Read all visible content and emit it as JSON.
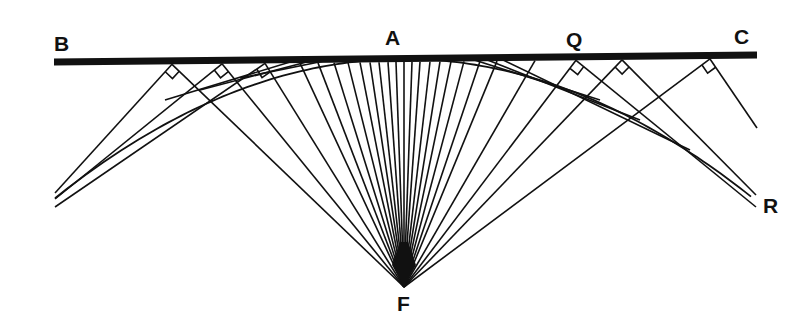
{
  "figure": {
    "colors": {
      "ink": "#111111",
      "background": "#ffffff"
    },
    "line_bc": {
      "x1": 54,
      "y1": 62,
      "x2": 757,
      "y2": 55,
      "width": 7
    },
    "focus": {
      "x": 404,
      "y": 287
    },
    "ray_points_x": [
      172,
      222,
      265,
      300,
      318,
      334,
      348,
      360,
      370,
      379,
      388,
      396,
      404,
      412,
      420,
      430,
      440,
      451,
      464,
      480,
      497,
      535,
      576,
      622,
      710
    ],
    "tangent_points": [
      {
        "x": 172,
        "end": [
          55,
          193
        ],
        "right_angle": true
      },
      {
        "x": 222,
        "end": [
          55,
          199
        ],
        "right_angle": true
      },
      {
        "x": 265,
        "end": [
          55,
          207
        ],
        "right_angle": true
      },
      {
        "x": 576,
        "end": [
          756,
          207
        ],
        "right_angle": true
      },
      {
        "x": 622,
        "end": [
          756,
          195
        ],
        "right_angle": true
      },
      {
        "x": 710,
        "end": [
          757,
          128
        ],
        "right_angle": true
      }
    ],
    "near_tangents": [
      {
        "x1": 300,
        "y1": 59,
        "x2": 165,
        "y2": 100
      },
      {
        "x1": 318,
        "y1": 59,
        "x2": 200,
        "y2": 90
      },
      {
        "x1": 334,
        "y1": 59,
        "x2": 240,
        "y2": 78
      },
      {
        "x1": 480,
        "y1": 57,
        "x2": 640,
        "y2": 120
      },
      {
        "x1": 497,
        "y1": 57,
        "x2": 690,
        "y2": 150
      },
      {
        "x1": 465,
        "y1": 57,
        "x2": 600,
        "y2": 100
      }
    ]
  },
  "labels": {
    "B": {
      "text": "B",
      "x": 54,
      "y": 33
    },
    "A": {
      "text": "A",
      "x": 385,
      "y": 27
    },
    "Q": {
      "text": "Q",
      "x": 566,
      "y": 29
    },
    "C": {
      "text": "C",
      "x": 734,
      "y": 26
    },
    "R": {
      "text": "R",
      "x": 763,
      "y": 195
    },
    "F": {
      "text": "F",
      "x": 397,
      "y": 293
    }
  }
}
